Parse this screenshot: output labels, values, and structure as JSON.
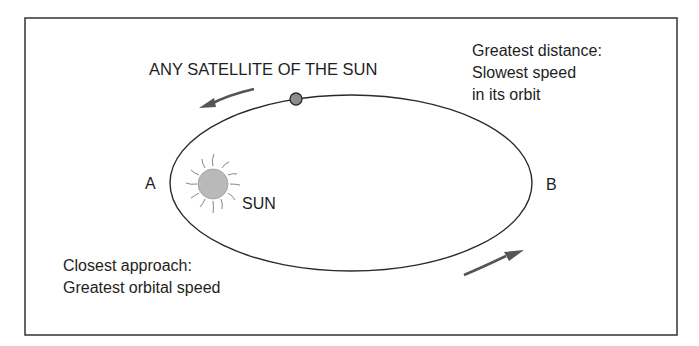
{
  "diagram": {
    "title": "ANY SATELLITE OF THE SUN",
    "labels": {
      "point_a": "A",
      "point_b": "B",
      "sun": "SUN"
    },
    "annotations": {
      "greatest_distance": [
        "Greatest distance:",
        "Slowest speed",
        "in its orbit"
      ],
      "closest_approach": [
        "Closest approach:",
        "Greatest orbital speed"
      ]
    },
    "icons": {
      "sun": "sun-icon",
      "satellite": "satellite-dot-icon",
      "arrows": [
        "direction-arrow-top-left-icon",
        "direction-arrow-bottom-right-icon"
      ]
    },
    "colors": {
      "line": "#2a2a2a",
      "arrow": "#555555",
      "sun_fill": "#b9b9b9",
      "satellite_fill": "#8c8c8c",
      "frame": "#333333"
    }
  }
}
